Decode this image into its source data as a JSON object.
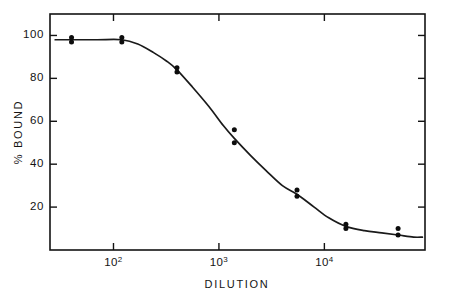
{
  "chart_data": {
    "type": "scatter",
    "title": "",
    "subtitle": "",
    "xlabel": "DILUTION",
    "ylabel": "% BOUND",
    "xscale": "log",
    "yscale": "linear",
    "xlim": [
      25,
      90000
    ],
    "ylim": [
      0,
      110
    ],
    "grid": false,
    "legend": null,
    "x_tick_labels": [
      "10",
      "10",
      "10"
    ],
    "x_tick_exponents": [
      "2",
      "3",
      "4"
    ],
    "x_tick_values": [
      100,
      1000,
      10000
    ],
    "y_tick_labels": [
      "100",
      "80",
      "60",
      "40",
      "20"
    ],
    "y_tick_values": [
      100,
      80,
      60,
      40,
      20
    ],
    "points": [
      {
        "x": 40,
        "y": 99
      },
      {
        "x": 40,
        "y": 97
      },
      {
        "x": 120,
        "y": 99
      },
      {
        "x": 120,
        "y": 97
      },
      {
        "x": 400,
        "y": 85
      },
      {
        "x": 400,
        "y": 83
      },
      {
        "x": 1400,
        "y": 56
      },
      {
        "x": 1400,
        "y": 50
      },
      {
        "x": 5500,
        "y": 28
      },
      {
        "x": 5500,
        "y": 25
      },
      {
        "x": 16000,
        "y": 12
      },
      {
        "x": 16000,
        "y": 10
      },
      {
        "x": 50000,
        "y": 10
      },
      {
        "x": 50000,
        "y": 7
      }
    ],
    "fit_curve": [
      {
        "x": 28,
        "y": 98
      },
      {
        "x": 40,
        "y": 98
      },
      {
        "x": 70,
        "y": 98
      },
      {
        "x": 120,
        "y": 98
      },
      {
        "x": 170,
        "y": 96
      },
      {
        "x": 240,
        "y": 92
      },
      {
        "x": 320,
        "y": 88
      },
      {
        "x": 400,
        "y": 84
      },
      {
        "x": 560,
        "y": 76
      },
      {
        "x": 800,
        "y": 67
      },
      {
        "x": 1100,
        "y": 58
      },
      {
        "x": 1400,
        "y": 52
      },
      {
        "x": 2000,
        "y": 44
      },
      {
        "x": 2800,
        "y": 37
      },
      {
        "x": 4000,
        "y": 30
      },
      {
        "x": 5500,
        "y": 26
      },
      {
        "x": 8000,
        "y": 20
      },
      {
        "x": 11000,
        "y": 15
      },
      {
        "x": 16000,
        "y": 11
      },
      {
        "x": 24000,
        "y": 9
      },
      {
        "x": 35000,
        "y": 8
      },
      {
        "x": 50000,
        "y": 7
      },
      {
        "x": 70000,
        "y": 6
      },
      {
        "x": 85000,
        "y": 6
      }
    ],
    "colors": {
      "axis": "#131313",
      "curve": "#1a1a1a",
      "points": "#0d0d0d",
      "background": "#ffffff"
    }
  }
}
